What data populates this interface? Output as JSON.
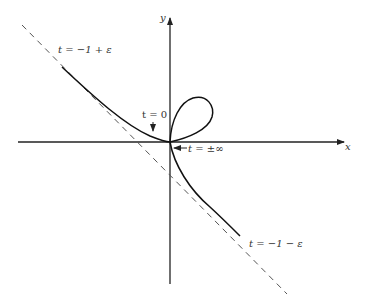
{
  "diagram": {
    "axes": {
      "x_label": "x",
      "y_label": "y"
    },
    "labels": {
      "upper_branch": "t = −1 + ε",
      "lower_branch": "t = −1 − ε",
      "t_zero": "t = 0",
      "t_inf": "t = ±∞"
    },
    "colors": {
      "curve": "#111111",
      "axis": "#222222",
      "asymptote": "#555555"
    }
  }
}
